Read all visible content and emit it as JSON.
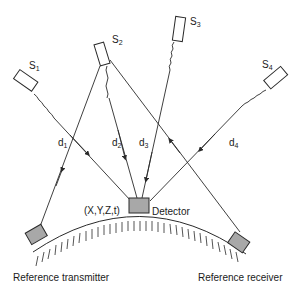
{
  "diagram": {
    "satellites": [
      {
        "name": "S",
        "sub": "1"
      },
      {
        "name": "S",
        "sub": "2"
      },
      {
        "name": "S",
        "sub": "3"
      },
      {
        "name": "S",
        "sub": "4"
      }
    ],
    "distances": [
      {
        "name": "d",
        "sub": "1"
      },
      {
        "name": "d",
        "sub": "2"
      },
      {
        "name": "d",
        "sub": "3"
      },
      {
        "name": "d",
        "sub": "4"
      }
    ],
    "detector_label": "Detector",
    "coordinates_label": "(X,Y,Z,t)",
    "reference_transmitter_label": "Reference transmitter",
    "reference_receiver_label": "Reference receiver",
    "colors": {
      "line": "#2a2a2a",
      "device_fill": "#a8a8a8"
    }
  }
}
